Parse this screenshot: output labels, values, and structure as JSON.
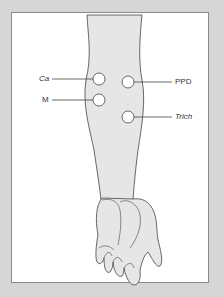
{
  "diagram": {
    "colors": {
      "background": "#d6d6d6",
      "panel": "#ffffff",
      "skin": "#e6e6e6",
      "outline": "#444444"
    },
    "sites": [
      {
        "label": "Ca",
        "italic": true,
        "side": "left",
        "cx": 99,
        "cy": 79
      },
      {
        "label": "M",
        "italic": false,
        "side": "left",
        "cx": 99,
        "cy": 100
      },
      {
        "label": "PPD",
        "italic": false,
        "side": "right",
        "cx": 128,
        "cy": 82
      },
      {
        "label": "Trich",
        "italic": true,
        "side": "right",
        "cx": 128,
        "cy": 117
      }
    ]
  }
}
